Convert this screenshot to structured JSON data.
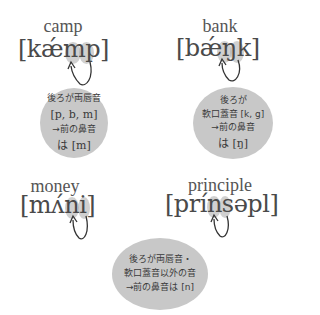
{
  "examples": [
    {
      "word": "camp",
      "ipa": "[kǽmp]",
      "rule": [
        "後ろが両唇音",
        "[p, b, m]",
        "→前の鼻音",
        "は [m]"
      ]
    },
    {
      "word": "bank",
      "ipa": "[bǽŋk]",
      "rule": [
        "後ろが",
        "軟口蓋音 [k, g]",
        "→前の鼻音",
        "は [ŋ]"
      ]
    },
    {
      "word": "money",
      "ipa": "[mʌ́ni]",
      "rule": []
    },
    {
      "word": "principle",
      "ipa": "[prínsəpl]",
      "rule": [
        "後ろが両唇音・",
        "軟口蓋音以外の音",
        "→前の鼻音は [n]"
      ]
    }
  ],
  "colors": {
    "bubble": "#c8c8c8",
    "highlight": "#aaaaaa",
    "text": "#4a4a4a"
  }
}
